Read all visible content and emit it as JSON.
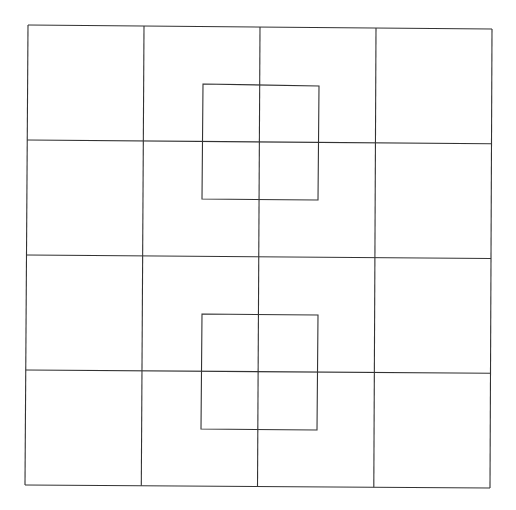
{
  "diagram": {
    "title": "",
    "background": "#ffffff",
    "stroke_color": "#333333",
    "outer_grid": {
      "rows": 4,
      "cols": 4,
      "corners": {
        "top_left": [
          28,
          25
        ],
        "top_right": [
          492,
          29
        ],
        "bottom_right": [
          490,
          488
        ],
        "bottom_left": [
          25,
          485
        ]
      }
    },
    "inner_squares": [
      {
        "name": "upper-center-square",
        "points": [
          [
            203,
            84
          ],
          [
            319,
            86
          ],
          [
            318,
            200
          ],
          [
            202,
            199
          ]
        ]
      },
      {
        "name": "lower-center-square",
        "points": [
          [
            202,
            314
          ],
          [
            318,
            315
          ],
          [
            317,
            430
          ],
          [
            201,
            429
          ]
        ]
      }
    ],
    "labels": []
  }
}
